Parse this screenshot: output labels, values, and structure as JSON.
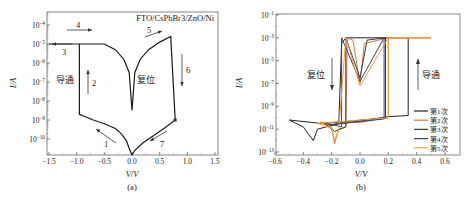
{
  "chart_data": [
    {
      "panel": "(a)",
      "type": "line",
      "title": "",
      "annotation_device": "FTO/CsPbBr3/ZnO/Ni",
      "xlabel": "V/V",
      "ylabel": "I/A",
      "xlim": [
        -1.5,
        1.5
      ],
      "ylim_log10": [
        -10.85,
        -3.6
      ],
      "yscale": "log",
      "xticks": [
        "-1.5",
        "-1.0",
        "-0.5",
        "0.0",
        "0.5",
        "1.0",
        "1.5"
      ],
      "yticks": [
        "10^-4",
        "10^-5",
        "10^-6",
        "10^-7",
        "10^-8",
        "10^-9",
        "10^-10"
      ],
      "grid": false,
      "region_labels": [
        {
          "text": "导通",
          "meaning": "SET / ON",
          "x": -1.2,
          "logy": -7.0
        },
        {
          "text": "复位",
          "meaning": "RESET / OFF",
          "x": 0.45,
          "logy": -7.0
        }
      ],
      "sweep_arrows": [
        {
          "label": "1",
          "direction": "up-left",
          "x": -0.25,
          "logy": -10.0
        },
        {
          "label": "2",
          "direction": "up",
          "x": -0.85,
          "logy": -7.0
        },
        {
          "label": "3",
          "direction": "left",
          "x": -1.35,
          "logy": -5.1
        },
        {
          "label": "4",
          "direction": "right",
          "x": -1.05,
          "logy": -4.4
        },
        {
          "label": "5",
          "direction": "right",
          "x": 0.55,
          "logy": -4.5
        },
        {
          "label": "6",
          "direction": "down",
          "x": 1.0,
          "logy": -6.5
        },
        {
          "label": "7",
          "direction": "down-left",
          "x": 0.5,
          "logy": -10.0
        }
      ],
      "series": [
        {
          "name": "I-V sweep",
          "color": "#1a1a1a",
          "points": [
            [
              0.0,
              -10.85
            ],
            [
              -0.05,
              -10.5
            ],
            [
              -0.1,
              -10.1
            ],
            [
              -0.2,
              -9.7
            ],
            [
              -0.3,
              -9.45
            ],
            [
              -0.5,
              -9.2
            ],
            [
              -0.7,
              -9.0
            ],
            [
              -0.95,
              -8.7
            ],
            [
              -0.95,
              -5.0
            ],
            [
              -1.5,
              -5.0
            ],
            [
              -0.95,
              -5.0
            ],
            [
              -0.5,
              -5.0
            ],
            [
              -0.3,
              -5.3
            ],
            [
              -0.15,
              -5.8
            ],
            [
              -0.05,
              -6.5
            ],
            [
              0.0,
              -8.5
            ],
            [
              0.05,
              -6.5
            ],
            [
              0.15,
              -5.8
            ],
            [
              0.3,
              -5.3
            ],
            [
              0.5,
              -4.9
            ],
            [
              0.7,
              -4.6
            ],
            [
              0.78,
              -9.0
            ],
            [
              0.6,
              -9.4
            ],
            [
              0.4,
              -9.8
            ],
            [
              0.2,
              -10.2
            ],
            [
              0.05,
              -10.6
            ],
            [
              0.0,
              -10.85
            ]
          ]
        }
      ],
      "markers": [
        {
          "x": 0.78,
          "logy": -9.0,
          "shape": "square"
        }
      ]
    },
    {
      "panel": "(b)",
      "type": "line",
      "title": "",
      "xlabel": "V/V",
      "ylabel": "I/A",
      "xlim": [
        -0.6,
        0.7
      ],
      "ylim_log10": [
        -13,
        -1
      ],
      "yscale": "log",
      "xticks": [
        "-0.6",
        "-0.4",
        "-0.2",
        "0.0",
        "0.2",
        "0.4",
        "0.6"
      ],
      "yticks": [
        "10^-1",
        "10^-3",
        "10^-5",
        "10^-7",
        "10^-9",
        "10^-11",
        "10^-13"
      ],
      "grid": false,
      "legend_position": "lower right",
      "region_labels": [
        {
          "text": "复位",
          "meaning": "RESET",
          "arrow": "down",
          "x": -0.2,
          "logy": -6.5
        },
        {
          "text": "导通",
          "meaning": "SET",
          "arrow": "up",
          "x": 0.4,
          "logy": -6.5
        }
      ],
      "series": [
        {
          "name": "第1次",
          "color": "#222222",
          "points": [
            [
              -0.5,
              -10.2
            ],
            [
              -0.4,
              -10.8
            ],
            [
              -0.33,
              -12.0
            ],
            [
              -0.3,
              -11.0
            ],
            [
              -0.15,
              -10.5
            ],
            [
              -0.13,
              -3.5
            ],
            [
              -0.1,
              -3.0
            ],
            [
              0.0,
              -3.0
            ],
            [
              0.34,
              -3.0
            ],
            [
              0.34,
              -9.8
            ],
            [
              0.2,
              -9.9
            ],
            [
              0.0,
              -10.3
            ],
            [
              -0.2,
              -10.6
            ],
            [
              -0.5,
              -10.2
            ]
          ]
        },
        {
          "name": "第2次",
          "color": "#e8743b",
          "points": [
            [
              -0.28,
              -10.4
            ],
            [
              -0.2,
              -10.8
            ],
            [
              -0.18,
              -12.3
            ],
            [
              -0.15,
              -11.0
            ],
            [
              -0.1,
              -10.8
            ],
            [
              -0.09,
              -3.0
            ],
            [
              -0.05,
              -3.2
            ],
            [
              0.0,
              -7.0
            ],
            [
              0.03,
              -3.5
            ],
            [
              0.2,
              -3.0
            ],
            [
              0.5,
              -3.0
            ],
            [
              0.2,
              -3.0
            ],
            [
              0.2,
              -10.0
            ],
            [
              0.0,
              -10.4
            ],
            [
              -0.28,
              -10.4
            ]
          ]
        },
        {
          "name": "第3次",
          "color": "#3a3a3a",
          "points": [
            [
              -0.25,
              -10.5
            ],
            [
              -0.18,
              -11.2
            ],
            [
              -0.1,
              -10.8
            ],
            [
              -0.1,
              -3.0
            ],
            [
              0.0,
              -6.5
            ],
            [
              0.05,
              -3.2
            ],
            [
              0.18,
              -3.0
            ],
            [
              0.18,
              -10.0
            ],
            [
              -0.25,
              -10.5
            ]
          ]
        },
        {
          "name": "第4次",
          "color": "#3b3f6e",
          "points": [
            [
              -0.2,
              -10.6
            ],
            [
              -0.13,
              -10.8
            ],
            [
              -0.13,
              -3.0
            ],
            [
              0.0,
              -6.8
            ],
            [
              0.17,
              -3.0
            ],
            [
              0.17,
              -10.1
            ],
            [
              -0.2,
              -10.6
            ]
          ]
        },
        {
          "name": "第5次",
          "color": "#f0a040",
          "points": [
            [
              -0.3,
              -10.5
            ],
            [
              -0.2,
              -10.9
            ],
            [
              -0.18,
              -12.0
            ],
            [
              -0.15,
              -11.0
            ],
            [
              -0.1,
              -3.0
            ],
            [
              0.0,
              -7.2
            ],
            [
              0.2,
              -3.0
            ],
            [
              0.5,
              -3.0
            ],
            [
              0.2,
              -3.0
            ],
            [
              0.2,
              -10.0
            ],
            [
              -0.3,
              -10.5
            ]
          ]
        }
      ]
    }
  ],
  "figure": {
    "panel_a_caption": "(a)",
    "panel_b_caption": "(b)",
    "panel_a_xlabel": "V/V",
    "panel_a_ylabel": "I/A",
    "panel_b_xlabel": "V/V",
    "panel_b_ylabel": "I/A",
    "device_label": "FTO/CsPbBr3/ZnO/Ni",
    "label_on_a": "导通",
    "label_off_a": "复位",
    "label_off_b": "复位",
    "label_on_b": "导通",
    "arrow_labels": [
      "1",
      "2",
      "3",
      "4",
      "5",
      "6",
      "7"
    ],
    "legend": [
      "第1次",
      "第2次",
      "第3次",
      "第4次",
      "第5次"
    ],
    "legend_colors": [
      "#222222",
      "#e8743b",
      "#3a3a3a",
      "#3b3f6e",
      "#f0a040"
    ]
  }
}
